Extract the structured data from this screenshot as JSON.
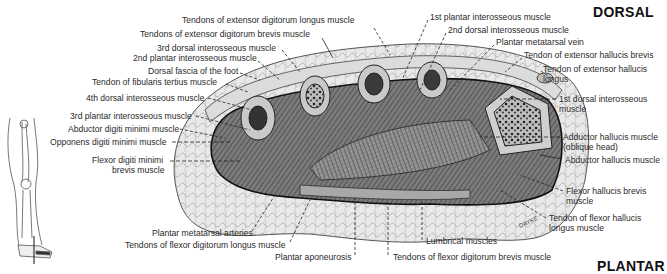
{
  "orientation": {
    "top": "DORSAL",
    "bottom": "PLANTAR"
  },
  "signature": "DAYKE",
  "labels_left": [
    {
      "id": "l1",
      "text": "Tendons of extensor digitorum longus muscle",
      "x": 182,
      "y": 20
    },
    {
      "id": "l2",
      "text": "Tendons of extensor digitorum brevis muscle",
      "x": 140,
      "y": 33
    },
    {
      "id": "l3",
      "text": "3rd dorsal interosseous muscle",
      "x": 157,
      "y": 47
    },
    {
      "id": "l4",
      "text": "2nd plantar interosseous muscle",
      "x": 133,
      "y": 57
    },
    {
      "id": "l5",
      "text": "Dorsal fascia of the foot",
      "x": 148,
      "y": 69
    },
    {
      "id": "l6",
      "text": "Tendon of fibularis tertius muscle",
      "x": 92,
      "y": 80
    },
    {
      "id": "l7",
      "text": "4th dorsal interosseous muscle",
      "x": 86,
      "y": 94
    },
    {
      "id": "l8",
      "text": "3rd plantar interosseous muscle",
      "x": 70,
      "y": 112
    },
    {
      "id": "l9",
      "text": "Abductor digiti minimi muscle",
      "x": 68,
      "y": 125
    },
    {
      "id": "l10",
      "text": "Opponens digiti minimi muscle",
      "x": 50,
      "y": 138
    },
    {
      "id": "l11a",
      "text": "Flexor digiti minimi",
      "x": 92,
      "y": 156
    },
    {
      "id": "l11b",
      "text": "brevis muscle",
      "x": 112,
      "y": 166
    }
  ],
  "labels_right": [
    {
      "id": "r1",
      "text": "1st plantar interosseous muscle",
      "x": 430,
      "y": 15
    },
    {
      "id": "r2",
      "text": "2nd dorsal interosseous muscle",
      "x": 448,
      "y": 28
    },
    {
      "id": "r3",
      "text": "Plantar metatarsal vein",
      "x": 496,
      "y": 40
    },
    {
      "id": "r4",
      "text": "Tendon of extensor hallucis brevis",
      "x": 524,
      "y": 53
    },
    {
      "id": "r5a",
      "text": "Tendon of extensor hallucis",
      "x": 543,
      "y": 66
    },
    {
      "id": "r5b",
      "text": "longus",
      "x": 543,
      "y": 76
    },
    {
      "id": "r6a",
      "text": "1st dorsal interosseous",
      "x": 559,
      "y": 97
    },
    {
      "id": "r6b",
      "text": "muscle",
      "x": 559,
      "y": 107
    },
    {
      "id": "r7a",
      "text": "Adductor hallucis muscle",
      "x": 563,
      "y": 134
    },
    {
      "id": "r7b",
      "text": "(oblique head)",
      "x": 563,
      "y": 144
    },
    {
      "id": "r8",
      "text": "Abductor hallucis muscle",
      "x": 565,
      "y": 156
    },
    {
      "id": "r9a",
      "text": "Flexor hallucis brevis",
      "x": 566,
      "y": 188
    },
    {
      "id": "r9b",
      "text": "muscle",
      "x": 566,
      "y": 198
    },
    {
      "id": "r10a",
      "text": "Tendon of flexor hallucis",
      "x": 549,
      "y": 214
    },
    {
      "id": "r10b",
      "text": "longus muscle",
      "x": 549,
      "y": 224
    }
  ],
  "labels_bottom": [
    {
      "id": "b1",
      "text": "Plantar metatarsal arteries",
      "x": 152,
      "y": 229
    },
    {
      "id": "b2",
      "text": "Tendons of flexor digitorum longus muscle",
      "x": 125,
      "y": 241
    },
    {
      "id": "b3",
      "text": "Plantar aponeurosis",
      "x": 275,
      "y": 253
    },
    {
      "id": "b4",
      "text": "Lumbrical muscles",
      "x": 426,
      "y": 237
    },
    {
      "id": "b5",
      "text": "Tendons of flexor digitorum brevis muscle",
      "x": 393,
      "y": 253
    }
  ]
}
